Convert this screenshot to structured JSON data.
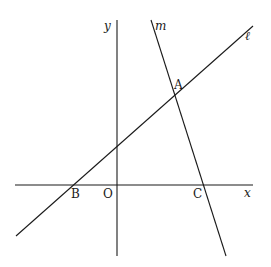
{
  "diagram": {
    "type": "coordinate-geometry",
    "axes": {
      "x_label": "x",
      "y_label": "y",
      "origin_label": "O"
    },
    "lines": [
      {
        "name": "ℓ",
        "passes_through": [
          "B",
          "A"
        ]
      },
      {
        "name": "m",
        "passes_through": [
          "A",
          "C"
        ]
      }
    ],
    "points": [
      {
        "label": "A",
        "description": "intersection of ℓ and m"
      },
      {
        "label": "B",
        "description": "intersection of ℓ and x-axis"
      },
      {
        "label": "C",
        "description": "intersection of m and x-axis"
      },
      {
        "label": "O",
        "description": "origin"
      }
    ],
    "labels": {
      "x": "x",
      "y": "y",
      "l": "ℓ",
      "m": "m",
      "A": "A",
      "B": "B",
      "C": "C",
      "O": "O"
    }
  }
}
